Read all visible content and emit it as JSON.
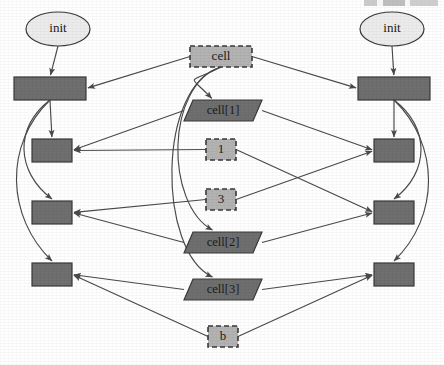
{
  "diagram": {
    "colors": {
      "canvas": "#ffffff",
      "dark_node_fill": "#6f6f6f",
      "light_node_fill": "#b3b3b3",
      "ellipse_fill": "#ececec",
      "node_stroke": "#3a3a3a",
      "edge_stroke": "#4a4a4a",
      "label_color": "#1b1b1b"
    },
    "nodes": {
      "init_left": {
        "label": "init",
        "shape": "ellipse",
        "style": "solid",
        "fill": "ellipse",
        "cx": 58,
        "cy": 29,
        "rx": 32,
        "ry": 17
      },
      "init_right": {
        "label": "init",
        "shape": "ellipse",
        "style": "solid",
        "fill": "ellipse",
        "cx": 392,
        "cy": 29,
        "rx": 32,
        "ry": 17
      },
      "left_box_1": {
        "label": "",
        "shape": "rect",
        "style": "solid",
        "fill": "dark",
        "x": 14,
        "y": 77,
        "w": 72,
        "h": 23
      },
      "left_box_2": {
        "label": "",
        "shape": "rect",
        "style": "solid",
        "fill": "dark",
        "x": 32,
        "y": 139,
        "w": 40,
        "h": 23
      },
      "left_box_3": {
        "label": "",
        "shape": "rect",
        "style": "solid",
        "fill": "dark",
        "x": 32,
        "y": 201,
        "w": 40,
        "h": 23
      },
      "left_box_4": {
        "label": "",
        "shape": "rect",
        "style": "solid",
        "fill": "dark",
        "x": 32,
        "y": 263,
        "w": 40,
        "h": 23
      },
      "right_box_1": {
        "label": "",
        "shape": "rect",
        "style": "solid",
        "fill": "dark",
        "x": 358,
        "y": 77,
        "w": 72,
        "h": 23
      },
      "right_box_2": {
        "label": "",
        "shape": "rect",
        "style": "solid",
        "fill": "dark",
        "x": 374,
        "y": 139,
        "w": 40,
        "h": 23
      },
      "right_box_3": {
        "label": "",
        "shape": "rect",
        "style": "solid",
        "fill": "dark",
        "x": 374,
        "y": 201,
        "w": 40,
        "h": 23
      },
      "right_box_4": {
        "label": "",
        "shape": "rect",
        "style": "solid",
        "fill": "dark",
        "x": 374,
        "y": 263,
        "w": 40,
        "h": 23
      },
      "cell": {
        "label": "cell",
        "shape": "rect",
        "style": "dashed",
        "fill": "light",
        "x": 190,
        "y": 46,
        "w": 62,
        "h": 21
      },
      "cell1": {
        "label": "cell[1]",
        "shape": "parallelogram",
        "style": "solid",
        "fill": "dark",
        "x": 184,
        "y": 100,
        "w": 78,
        "h": 21
      },
      "const_1": {
        "label": "1",
        "shape": "rect",
        "style": "dashed",
        "fill": "light",
        "x": 206,
        "y": 139,
        "w": 30,
        "h": 21
      },
      "const_3": {
        "label": "3",
        "shape": "rect",
        "style": "dashed",
        "fill": "light",
        "x": 206,
        "y": 189,
        "w": 30,
        "h": 21
      },
      "cell2": {
        "label": "cell[2]",
        "shape": "parallelogram",
        "style": "solid",
        "fill": "dark",
        "x": 184,
        "y": 232,
        "w": 78,
        "h": 21
      },
      "cell3": {
        "label": "cell[3]",
        "shape": "parallelogram",
        "style": "solid",
        "fill": "dark",
        "x": 184,
        "y": 279,
        "w": 78,
        "h": 21
      },
      "const_b": {
        "label": "b",
        "shape": "rect",
        "style": "dashed",
        "fill": "light",
        "x": 208,
        "y": 326,
        "w": 30,
        "h": 21
      }
    },
    "edges": [
      {
        "from": "init_left",
        "to": "left_box_1",
        "arrow": true
      },
      {
        "from": "init_right",
        "to": "right_box_1",
        "arrow": true
      },
      {
        "from": "left_box_1",
        "to": "left_box_2",
        "arrow": true
      },
      {
        "from": "right_box_1",
        "to": "right_box_2",
        "arrow": true
      },
      {
        "from": "left_box_1",
        "to": "left_box_3",
        "arrow": true
      },
      {
        "from": "left_box_1",
        "to": "left_box_4",
        "arrow": true
      },
      {
        "from": "right_box_1",
        "to": "right_box_3",
        "arrow": true
      },
      {
        "from": "right_box_1",
        "to": "right_box_4",
        "arrow": true
      },
      {
        "from": "cell",
        "to": "left_box_1",
        "arrow": true
      },
      {
        "from": "cell",
        "to": "right_box_1",
        "arrow": true
      },
      {
        "from": "cell",
        "to": "cell1",
        "arrow": true
      },
      {
        "from": "cell",
        "to": "cell2",
        "arrow": true
      },
      {
        "from": "cell",
        "to": "cell3",
        "arrow": true
      },
      {
        "from": "cell1",
        "to": "left_box_2",
        "arrow": true
      },
      {
        "from": "cell1",
        "to": "right_box_2",
        "arrow": true
      },
      {
        "from": "const_1",
        "to": "left_box_2",
        "arrow": true
      },
      {
        "from": "const_1",
        "to": "right_box_3",
        "arrow": true
      },
      {
        "from": "const_3",
        "to": "left_box_3",
        "arrow": true
      },
      {
        "from": "const_3",
        "to": "right_box_2",
        "arrow": true
      },
      {
        "from": "cell2",
        "to": "left_box_3",
        "arrow": true
      },
      {
        "from": "cell2",
        "to": "right_box_3",
        "arrow": true
      },
      {
        "from": "cell3",
        "to": "left_box_4",
        "arrow": true
      },
      {
        "from": "cell3",
        "to": "right_box_4",
        "arrow": true
      },
      {
        "from": "const_b",
        "to": "left_box_4",
        "arrow": true
      },
      {
        "from": "const_b",
        "to": "right_box_4",
        "arrow": true
      }
    ]
  }
}
